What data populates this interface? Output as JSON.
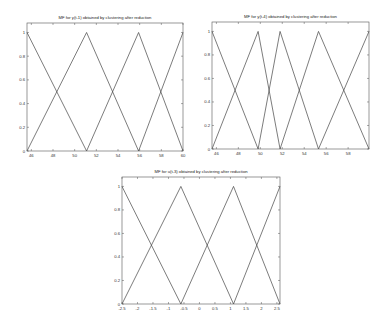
{
  "chart_data": [
    {
      "type": "line",
      "title": "MF for y(t-1) obtained by clustering after reduction",
      "xlabel": "",
      "ylabel": "",
      "xlim": [
        45.6,
        60
      ],
      "ylim": [
        0,
        1.08
      ],
      "x_ticks": [
        46,
        48,
        50,
        52,
        54,
        56,
        58,
        60
      ],
      "y_ticks": [
        0,
        0.2,
        0.4,
        0.6,
        0.8,
        1
      ],
      "y_tick_labels": [
        "0",
        "0.2",
        "0.4",
        "0.6",
        "0.8",
        "1"
      ],
      "grid": false,
      "series": [
        {
          "name": "MF1",
          "x": [
            45.6,
            51.1
          ],
          "y": [
            1,
            0
          ]
        },
        {
          "name": "MF2",
          "x": [
            45.6,
            51.1,
            55.9
          ],
          "y": [
            0,
            1,
            0
          ]
        },
        {
          "name": "MF3",
          "x": [
            51.1,
            55.9,
            60
          ],
          "y": [
            0,
            1,
            0
          ]
        },
        {
          "name": "MF4",
          "x": [
            55.9,
            60
          ],
          "y": [
            0,
            1
          ]
        }
      ],
      "box": {
        "left": 27,
        "top": 23,
        "right": 183,
        "bottom": 151
      }
    },
    {
      "type": "line",
      "title": "MF for y(t-4) obtained by clustering after reduction",
      "xlabel": "",
      "ylabel": "",
      "xlim": [
        45.6,
        59.9
      ],
      "ylim": [
        0,
        1.08
      ],
      "x_ticks": [
        46,
        48,
        50,
        52,
        54,
        56,
        58
      ],
      "y_ticks": [
        0,
        0.2,
        0.4,
        0.6,
        0.8,
        1
      ],
      "y_tick_labels": [
        "0",
        "0.2",
        "0.4",
        "0.6",
        "0.8",
        "1"
      ],
      "grid": false,
      "series": [
        {
          "name": "MF1",
          "x": [
            45.6,
            49.8
          ],
          "y": [
            1,
            0
          ]
        },
        {
          "name": "MF2",
          "x": [
            45.6,
            49.8,
            51.8
          ],
          "y": [
            0,
            1,
            0
          ]
        },
        {
          "name": "MF3",
          "x": [
            49.8,
            51.8,
            55.3
          ],
          "y": [
            0,
            1,
            0
          ]
        },
        {
          "name": "MF4",
          "x": [
            51.8,
            55.3,
            59.9
          ],
          "y": [
            0,
            1,
            0
          ]
        },
        {
          "name": "MF5",
          "x": [
            55.3,
            59.9
          ],
          "y": [
            0,
            1
          ]
        }
      ],
      "box": {
        "left": 212,
        "top": 22,
        "right": 369,
        "bottom": 149
      }
    },
    {
      "type": "line",
      "title": "MF for u(t-3) obtained by clustering after reduction",
      "xlabel": "",
      "ylabel": "",
      "xlim": [
        -2.5,
        2.6
      ],
      "ylim": [
        0,
        1.08
      ],
      "x_ticks": [
        -2.5,
        -2,
        -1.5,
        -1,
        -0.5,
        0,
        0.5,
        1,
        1.5,
        2,
        2.5
      ],
      "y_ticks": [
        0,
        0.2,
        0.4,
        0.6,
        0.8,
        1
      ],
      "y_tick_labels": [
        "0",
        "0.2",
        "0.4",
        "0.6",
        "0.8",
        "1"
      ],
      "grid": false,
      "series": [
        {
          "name": "MF1",
          "x": [
            -2.5,
            -0.6
          ],
          "y": [
            1,
            0
          ]
        },
        {
          "name": "MF2",
          "x": [
            -2.5,
            -0.6,
            1.1
          ],
          "y": [
            0,
            1,
            0
          ]
        },
        {
          "name": "MF3",
          "x": [
            -0.6,
            1.1,
            2.6
          ],
          "y": [
            0,
            1,
            0
          ]
        },
        {
          "name": "MF4",
          "x": [
            1.1,
            2.6
          ],
          "y": [
            0,
            1
          ]
        }
      ],
      "box": {
        "left": 122,
        "top": 177,
        "right": 280,
        "bottom": 304
      }
    }
  ]
}
